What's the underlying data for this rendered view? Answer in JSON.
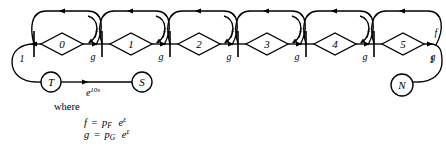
{
  "diagram": {
    "type": "signal-flow-graph",
    "title": "",
    "stages": [
      {
        "index": 0,
        "node_label": "0",
        "branch_upper_label": "f",
        "branch_lower_label": "g"
      },
      {
        "index": 1,
        "node_label": "1",
        "branch_upper_label": "f",
        "branch_lower_label": "g"
      },
      {
        "index": 2,
        "node_label": "2",
        "branch_upper_label": "f",
        "branch_lower_label": "g"
      },
      {
        "index": 3,
        "node_label": "3",
        "branch_upper_label": "f",
        "branch_lower_label": "g"
      },
      {
        "index": 4,
        "node_label": "4",
        "branch_upper_label": "f",
        "branch_lower_label": "g"
      },
      {
        "index": 5,
        "node_label": "5",
        "branch_upper_label": "f",
        "branch_lower_label": "g"
      }
    ],
    "feedback_arcs_count": 5,
    "left_loop_gain": "1",
    "right_loop_gain": "1",
    "source_node_label": "T",
    "sink_node_label": "S",
    "terminal_node_label": "N",
    "transmittance_label_base": "e",
    "transmittance_label_exponent": "10s"
  },
  "legend": {
    "where_word": "where",
    "equations": [
      {
        "lhs": "f",
        "eq": "=",
        "coef_base": "p",
        "coef_sub": "F",
        "exp_base": "e",
        "exp_sup": "ε"
      },
      {
        "lhs": "g",
        "eq": "=",
        "coef_base": "p",
        "coef_sub": "G",
        "exp_base": "e",
        "exp_sup": "ε"
      }
    ]
  },
  "colors": {
    "stroke": "#000000",
    "background": "#ffffff"
  }
}
